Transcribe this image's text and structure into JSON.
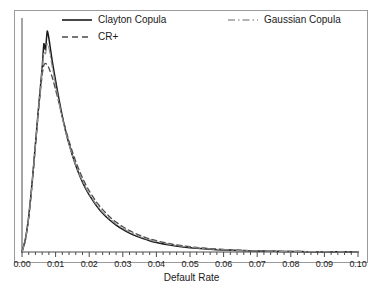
{
  "chart_data": {
    "type": "line",
    "title": "",
    "subtitle": "",
    "xlabel": "Default Rate",
    "ylabel": "",
    "xlim": [
      0.0,
      0.1
    ],
    "ylim": [
      0.0,
      1.0
    ],
    "grid": false,
    "legend_position": "top",
    "xticks": [
      "0.00",
      "0.01",
      "0.02",
      "0.03",
      "0.04",
      "0.05",
      "0.06",
      "0.07",
      "0.08",
      "0.09",
      "0.10"
    ],
    "xtick_values": [
      0.0,
      0.01,
      0.02,
      0.03,
      0.04,
      0.05,
      0.06,
      0.07,
      0.08,
      0.09,
      0.1
    ],
    "xminor_per_major": 5,
    "yticks": [],
    "x": [
      0.0,
      0.001,
      0.002,
      0.003,
      0.004,
      0.005,
      0.006,
      0.0065,
      0.007,
      0.0075,
      0.008,
      0.009,
      0.01,
      0.011,
      0.012,
      0.013,
      0.014,
      0.015,
      0.016,
      0.017,
      0.018,
      0.019,
      0.02,
      0.022,
      0.024,
      0.026,
      0.028,
      0.03,
      0.032,
      0.034,
      0.036,
      0.038,
      0.04,
      0.044,
      0.048,
      0.052,
      0.056,
      0.06,
      0.065,
      0.07,
      0.075,
      0.08,
      0.085,
      0.09,
      0.095,
      0.1
    ],
    "series": [
      {
        "name": "Clayton Copula",
        "color": "#1a1a1a",
        "style": "solid",
        "values": [
          0.0,
          0.055,
          0.155,
          0.3,
          0.47,
          0.64,
          0.8,
          0.905,
          0.88,
          0.96,
          0.93,
          0.83,
          0.745,
          0.665,
          0.59,
          0.525,
          0.47,
          0.42,
          0.376,
          0.338,
          0.304,
          0.274,
          0.248,
          0.204,
          0.168,
          0.14,
          0.117,
          0.098,
          0.082,
          0.069,
          0.058,
          0.049,
          0.041,
          0.03,
          0.022,
          0.016,
          0.012,
          0.0088,
          0.006,
          0.0042,
          0.0029,
          0.0021,
          0.0015,
          0.0011,
          0.0008,
          0.0006
        ]
      },
      {
        "name": "CR+",
        "color": "#4a4a4a",
        "style": "dashed",
        "values": [
          0.0,
          0.05,
          0.148,
          0.292,
          0.46,
          0.63,
          0.77,
          0.812,
          0.82,
          0.815,
          0.8,
          0.76,
          0.706,
          0.648,
          0.588,
          0.532,
          0.482,
          0.436,
          0.394,
          0.356,
          0.322,
          0.292,
          0.266,
          0.22,
          0.184,
          0.154,
          0.13,
          0.11,
          0.093,
          0.079,
          0.067,
          0.057,
          0.049,
          0.036,
          0.027,
          0.02,
          0.015,
          0.0112,
          0.0076,
          0.0053,
          0.0037,
          0.0026,
          0.0019,
          0.0014,
          0.001,
          0.0008
        ]
      },
      {
        "name": "Gaussian Copula",
        "color": "#8c8c8c",
        "style": "dashdot",
        "values": [
          0.0,
          0.052,
          0.15,
          0.296,
          0.466,
          0.636,
          0.79,
          0.87,
          0.862,
          0.905,
          0.89,
          0.805,
          0.726,
          0.652,
          0.582,
          0.52,
          0.468,
          0.42,
          0.378,
          0.341,
          0.308,
          0.279,
          0.253,
          0.209,
          0.173,
          0.145,
          0.122,
          0.103,
          0.087,
          0.074,
          0.062,
          0.053,
          0.045,
          0.033,
          0.024,
          0.018,
          0.013,
          0.0098,
          0.0067,
          0.0047,
          0.0033,
          0.0023,
          0.0017,
          0.0012,
          0.0009,
          0.0007
        ]
      }
    ]
  },
  "axis": {
    "xlabel": "Default Rate",
    "xticks": [
      {
        "label": "0.00"
      },
      {
        "label": "0.01"
      },
      {
        "label": "0.02"
      },
      {
        "label": "0.03"
      },
      {
        "label": "0.04"
      },
      {
        "label": "0.05"
      },
      {
        "label": "0.06"
      },
      {
        "label": "0.07"
      },
      {
        "label": "0.08"
      },
      {
        "label": "0.09"
      },
      {
        "label": "0.10"
      }
    ]
  },
  "legend": {
    "entries": [
      {
        "label": "Clayton Copula",
        "style": "solid",
        "color": "#1a1a1a"
      },
      {
        "label": "CR+",
        "style": "dashed",
        "color": "#4a4a4a"
      },
      {
        "label": "Gaussian Copula",
        "style": "dashdot",
        "color": "#8c8c8c"
      }
    ]
  }
}
